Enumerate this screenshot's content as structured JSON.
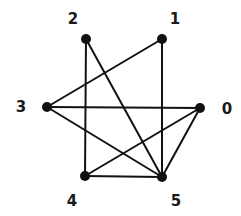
{
  "graph": {
    "colors": {
      "edge": "#111111",
      "node": "#111111",
      "label": "#1a1a1a",
      "background": "#ffffff"
    },
    "nodes": [
      {
        "id": "0",
        "label": "0",
        "x": 200,
        "y": 108,
        "lx": 227,
        "ly": 109
      },
      {
        "id": "1",
        "label": "1",
        "x": 162,
        "y": 39,
        "lx": 175,
        "ly": 19
      },
      {
        "id": "2",
        "label": "2",
        "x": 86,
        "y": 39,
        "lx": 73,
        "ly": 19
      },
      {
        "id": "3",
        "label": "3",
        "x": 47,
        "y": 107,
        "lx": 21,
        "ly": 107
      },
      {
        "id": "4",
        "label": "4",
        "x": 85,
        "y": 176,
        "lx": 72,
        "ly": 201
      },
      {
        "id": "5",
        "label": "5",
        "x": 162,
        "y": 177,
        "lx": 176,
        "ly": 201
      }
    ],
    "edges": [
      [
        "2",
        "4"
      ],
      [
        "2",
        "5"
      ],
      [
        "1",
        "3"
      ],
      [
        "1",
        "5"
      ],
      [
        "3",
        "0"
      ],
      [
        "3",
        "5"
      ],
      [
        "4",
        "0"
      ],
      [
        "4",
        "5"
      ],
      [
        "0",
        "5"
      ]
    ]
  }
}
